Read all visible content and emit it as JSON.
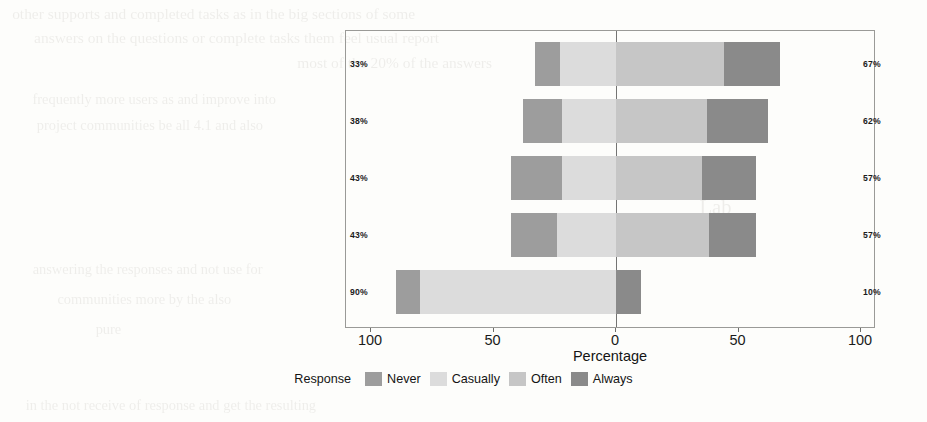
{
  "chart_data": {
    "type": "bar",
    "subtype": "diverging-stacked-bar",
    "title": "",
    "xlabel": "Percentage",
    "ylabel": "",
    "xlim": [
      -100,
      100
    ],
    "grid": false,
    "legend_position": "bottom",
    "legend_title": "Response",
    "tick_labels": [
      "100",
      "50",
      "0",
      "50",
      "100"
    ],
    "tick_values": [
      -100,
      -50,
      0,
      50,
      100
    ],
    "categories": [
      "How often did the developers in the communities treat your issues friendly and patiently?",
      "How often have your issues or questions got responses after published?",
      "How often did you get quick responses (less than 24 hours) from the communities?",
      "How often did you get satisfying answers from the communities?",
      "How often did you participate in the project-hosting communities and ask-quesion communities?"
    ],
    "series": [
      {
        "name": "Never",
        "color": "#9d9d9d",
        "values": [
          10,
          16,
          21,
          19,
          10
        ]
      },
      {
        "name": "Casually",
        "color": "#dcdcdc",
        "values": [
          23,
          22,
          22,
          24,
          80
        ]
      },
      {
        "name": "Often",
        "color": "#c6c6c6",
        "values": [
          44,
          37,
          35,
          38,
          0
        ]
      },
      {
        "name": "Always",
        "color": "#8a8a8a",
        "values": [
          23,
          25,
          22,
          19,
          10
        ]
      }
    ],
    "negative_totals": [
      "33%",
      "38%",
      "43%",
      "43%",
      "90%"
    ],
    "positive_totals": [
      "67%",
      "62%",
      "57%",
      "57%",
      "10%"
    ]
  },
  "ghost_text": [
    {
      "text": "other supports and completed tasks as in the big sections of some",
      "x": 18,
      "y": 6,
      "size": 15
    },
    {
      "text": "answers on the questions or complete tasks them feel usual report",
      "x": 40,
      "y": 30,
      "size": 15
    },
    {
      "text": "most of the 20% of the answers",
      "x": 300,
      "y": 55,
      "size": 15
    },
    {
      "text": "frequently more users as and improve into",
      "x": 36,
      "y": 92,
      "size": 14
    },
    {
      "text": "project communities be all 4.1 and also",
      "x": 40,
      "y": 118,
      "size": 14
    },
    {
      "text": "Lab",
      "x": 700,
      "y": 196,
      "size": 20
    },
    {
      "text": "Ossiel",
      "x": 540,
      "y": 222,
      "size": 22
    },
    {
      "text": "answering the responses and not use for",
      "x": 36,
      "y": 262,
      "size": 14
    },
    {
      "text": "communities more by the also",
      "x": 60,
      "y": 292,
      "size": 14
    },
    {
      "text": "pure",
      "x": 96,
      "y": 322,
      "size": 14
    },
    {
      "text": "in the not receive of response and get the resulting",
      "x": 30,
      "y": 398,
      "size": 14
    }
  ]
}
